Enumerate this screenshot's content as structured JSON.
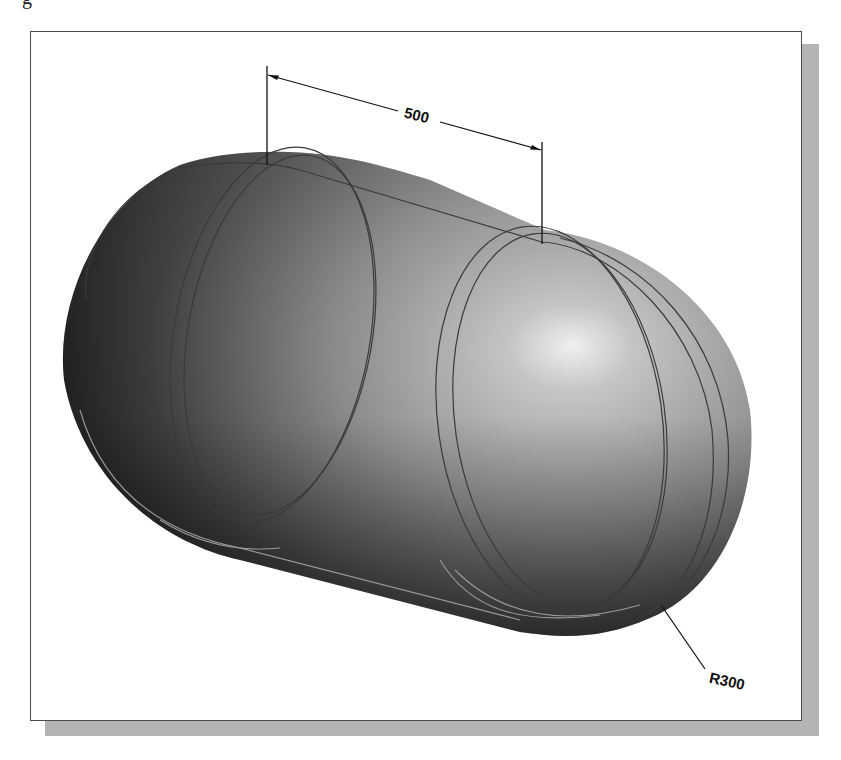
{
  "figure": {
    "caption_fragment": "g",
    "colors": {
      "frame_border": "#4a4a4a",
      "frame_shadow": "#b4b4b4",
      "body_dark": "#1e1e1e",
      "body_mid": "#7a7a7a",
      "highlight": "#f2f2f2",
      "edge_lines": "#3a3a3a",
      "lower_edge_lines": "#9a9a9a"
    }
  },
  "dimensions": {
    "length": {
      "label": "500",
      "type": "linear"
    },
    "radius": {
      "label": "R300",
      "type": "radial"
    }
  }
}
